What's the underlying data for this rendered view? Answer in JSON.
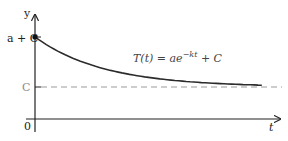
{
  "chart_data": {
    "type": "line",
    "title": "",
    "xlabel": "t",
    "ylabel": "y",
    "origin_label": "0",
    "y_tick_labels": [
      {
        "label": "a + C",
        "value": "a+C"
      },
      {
        "label": "C",
        "value": "C"
      }
    ],
    "curve_label": {
      "prefix": "T(t) = ae",
      "exponent": "−kt",
      "suffix": " + C"
    },
    "model": {
      "a": 1,
      "k": 1.1,
      "C": 1
    },
    "x_range": [
      0,
      3
    ],
    "xlim": [
      0,
      3.6
    ],
    "ylim": [
      0,
      2.55
    ],
    "asymptote": {
      "value": 1,
      "style": "dashed"
    },
    "initial_point": {
      "x": 0,
      "y": 2
    },
    "grid": false,
    "legend": "none",
    "colors": {
      "curve": "#2b2b2b",
      "axes": "#222222",
      "asymptote": "#9a9a9a",
      "c_label": "#8a8a8a"
    }
  }
}
